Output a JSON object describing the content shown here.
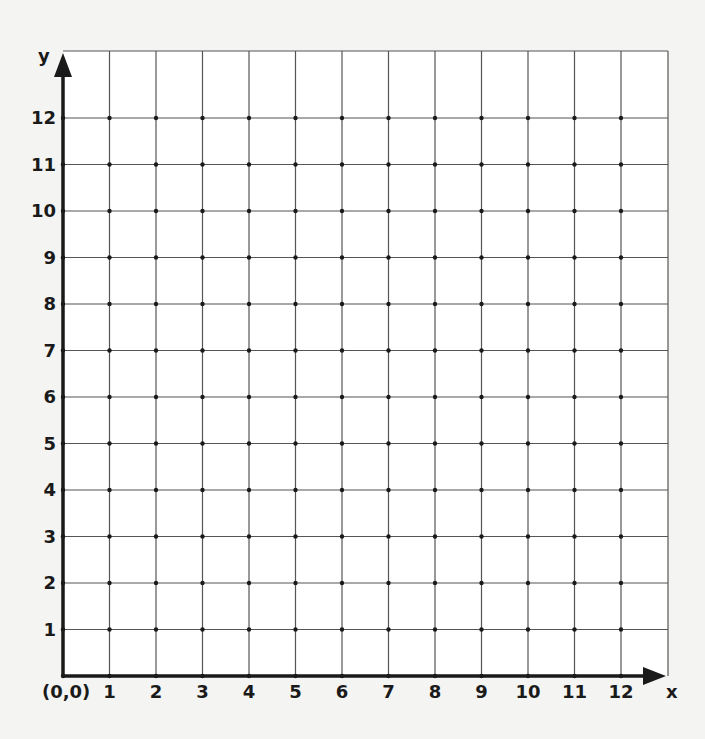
{
  "chart_data": {
    "type": "scatter",
    "title": "",
    "subtitle": "",
    "xlabel": "x",
    "ylabel": "y",
    "origin_label": "(0,0)",
    "xlim": [
      0,
      13
    ],
    "ylim": [
      0,
      13
    ],
    "grid": true,
    "legend": null,
    "x_ticks": [
      "1",
      "2",
      "3",
      "4",
      "5",
      "6",
      "7",
      "8",
      "9",
      "10",
      "11",
      "12"
    ],
    "y_ticks": [
      "1",
      "2",
      "3",
      "4",
      "5",
      "6",
      "7",
      "8",
      "9",
      "10",
      "11",
      "12"
    ],
    "x": [],
    "y": [],
    "series": []
  },
  "colors": {
    "background": "#f4f4f3",
    "plot_area": "#ffffff",
    "grid_line": "#555555",
    "axis": "#1a1a1a"
  }
}
